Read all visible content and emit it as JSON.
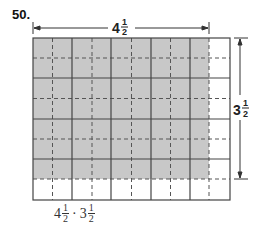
{
  "problem_number": "50.",
  "width_label": {
    "whole": "4",
    "num": "1",
    "den": "2"
  },
  "height_label": {
    "whole": "3",
    "num": "1",
    "den": "2"
  },
  "expression": {
    "a_whole": "4",
    "a_num": "1",
    "a_den": "2",
    "op": "·",
    "b_whole": "3",
    "b_num": "1",
    "b_den": "2"
  },
  "grid": {
    "columns": 5,
    "rows": 4,
    "subdivision": 2,
    "shaded_width": 4.5,
    "shaded_height": 3.5
  },
  "colors": {
    "shade": "#c8c8c8",
    "line": "#444444"
  }
}
